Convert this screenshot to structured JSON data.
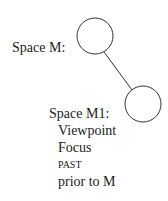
{
  "diagram": {
    "space_m": {
      "label": "Space M:"
    },
    "space_m1": {
      "label": "Space M1:",
      "lines": [
        "Viewpoint",
        "Focus",
        "PAST",
        "prior to M"
      ]
    }
  }
}
